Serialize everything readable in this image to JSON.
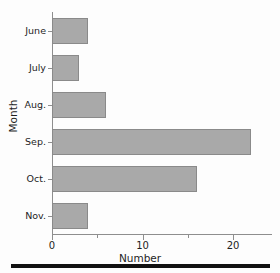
{
  "chart_data": {
    "type": "bar",
    "orientation": "horizontal",
    "title": "",
    "subtitle": "",
    "xlabel": "Number",
    "ylabel": "Month",
    "categories": [
      "June",
      "July",
      "Aug.",
      "Sep.",
      "Oct.",
      "Nov."
    ],
    "values": [
      4,
      3,
      6,
      22,
      16,
      4
    ],
    "series": [
      {
        "name": "Number",
        "values": [
          4,
          3,
          6,
          22,
          16,
          4
        ]
      }
    ],
    "xlim": [
      0,
      24.3
    ],
    "ylim": [
      0,
      6
    ],
    "xticks": [
      0,
      10,
      20
    ],
    "xticklabels": [
      "0",
      "10",
      "20"
    ],
    "xticks_minor": [
      5,
      15,
      20
    ],
    "yticklabels": [
      "June",
      "July",
      "Aug.",
      "Sep.",
      "Oct.",
      "Nov."
    ],
    "grid": false,
    "legend": false,
    "legend_position": "none",
    "bar_color": "#a9a9a9",
    "bar_edge_color": "#8a8a8a",
    "axis_color": "#8e8e8e",
    "text_color": "#1d1d1d",
    "background_color": "#fdfdfd"
  },
  "figure": {
    "bottom_rule_color": "#111111"
  }
}
